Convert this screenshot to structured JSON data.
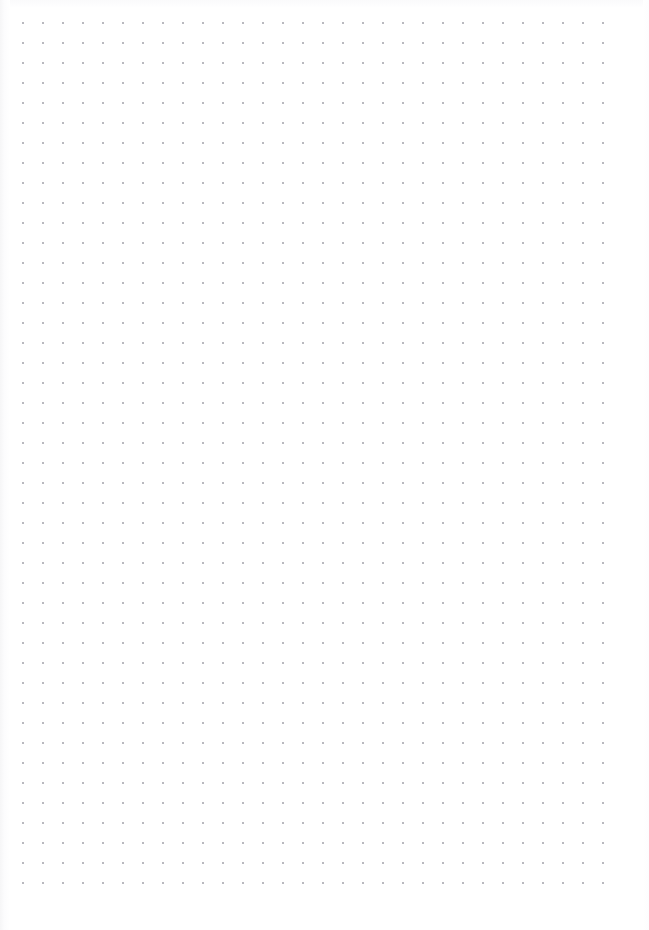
{
  "document": {
    "type": "dot-grid-paper",
    "title": "Blank dot grid page",
    "page_width": 649,
    "page_height": 930,
    "background_color": "#ffffff",
    "has_text": false,
    "has_images": false,
    "visible_text": ""
  },
  "grid": {
    "dot_color": "#b9b9bf",
    "dot_diameter_px": 1.6,
    "spacing_x_px": 20,
    "spacing_y_px": 20,
    "origin_x_px": 23,
    "origin_y_px": 23,
    "columns": 30,
    "rows": 44,
    "last_dot_x_px": 608,
    "last_dot_y_px": 888,
    "margin_left_px": 23,
    "margin_top_px": 23,
    "margin_right_px": 41,
    "margin_bottom_px": 42
  },
  "paper": {
    "edge_shadow_color": "#f6f6f7",
    "edge_shadow_width_px": 10
  }
}
